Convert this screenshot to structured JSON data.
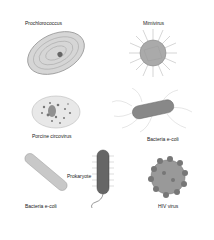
{
  "figure": {
    "organisms": [
      {
        "label": "Prochlorococcus"
      },
      {
        "label": "Mimivirus"
      },
      {
        "label": "Porcine circovirus"
      },
      {
        "label": "Bacteria e-coli"
      },
      {
        "label": "Bacteria e-coli"
      },
      {
        "label": "Prokaryote"
      },
      {
        "label": "HIV virus"
      }
    ]
  }
}
